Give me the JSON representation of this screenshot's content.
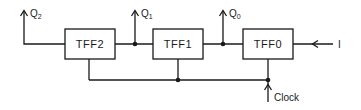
{
  "diagram": {
    "type": "block-diagram",
    "blocks": [
      {
        "id": "tff2",
        "label": "TFF2"
      },
      {
        "id": "tff1",
        "label": "TFF1"
      },
      {
        "id": "tff0",
        "label": "TFF0"
      }
    ],
    "outputs": [
      {
        "id": "q2",
        "base": "Q",
        "sub": "2"
      },
      {
        "id": "q1",
        "base": "Q",
        "sub": "1"
      },
      {
        "id": "q0",
        "base": "Q",
        "sub": "0"
      }
    ],
    "input": {
      "label": "I"
    },
    "clock": {
      "label": "Clock"
    },
    "colors": {
      "line": "#1a1a1a",
      "background": "#ffffff"
    }
  }
}
